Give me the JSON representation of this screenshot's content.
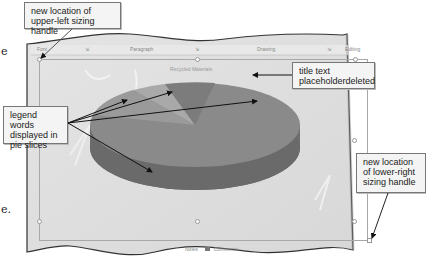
{
  "edge_text": {
    "top_left": "e",
    "bottom_left": "e."
  },
  "ribbon": {
    "groups": [
      "Font",
      "Paragraph",
      "Drawing",
      "Editing"
    ],
    "dialog_launcher": "⇲"
  },
  "slide": {
    "chart_title_ghost": "Recycled Materials",
    "pie_colors": {
      "top": "#8a8a8a",
      "side": "#6e6e6e",
      "light_slice": "#a9a9a9",
      "dark_slice": "#7c7c7c",
      "background": "#d9d9d9"
    }
  },
  "callouts": {
    "upper_left_handle": "new location of upper-left sizing handle",
    "title_deleted": "title text placeholderdeleted",
    "legend_words": "legend words displayed in pie slices",
    "lower_right_handle": "new location of lower-right sizing handle"
  },
  "statusbar": {
    "notes": "Notes",
    "comments": "Comments"
  }
}
